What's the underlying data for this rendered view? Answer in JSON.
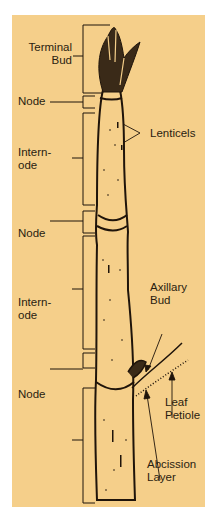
{
  "diagram": {
    "background_color": "#f5cf8a",
    "ink_color": "#1f140a",
    "left_labels": [
      {
        "id": "terminal-bud",
        "line1": "Terminal",
        "line2": "Bud"
      },
      {
        "id": "node-1",
        "line1": "Node"
      },
      {
        "id": "internode-1",
        "line1": "Intern-",
        "line2": "ode"
      },
      {
        "id": "node-2",
        "line1": "Node"
      },
      {
        "id": "internode-2",
        "line1": "Intern-",
        "line2": "ode"
      },
      {
        "id": "node-3",
        "line1": "Node"
      }
    ],
    "right_labels": [
      {
        "id": "lenticels",
        "line1": "Lenticels"
      },
      {
        "id": "axillary-bud",
        "line1": "Axillary",
        "line2": "Bud"
      },
      {
        "id": "leaf-petiole",
        "line1": "Leaf",
        "line2": "Petiole"
      },
      {
        "id": "abcission-layer",
        "line1": "Abcission",
        "line2": "Layer"
      }
    ]
  }
}
